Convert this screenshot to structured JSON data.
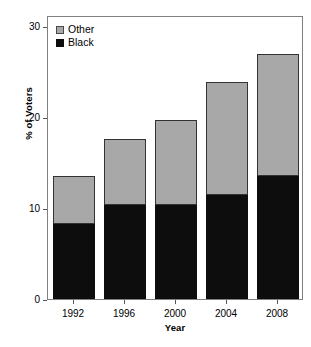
{
  "chart_data": {
    "type": "bar",
    "stacked": true,
    "title": "",
    "subtitle": "",
    "xlabel": "Year",
    "ylabel": "% of Voters",
    "categories": [
      "1992",
      "1996",
      "2000",
      "2004",
      "2008"
    ],
    "series": [
      {
        "name": "Black",
        "color": "#0d0d0d",
        "values": [
          8,
          10,
          10,
          11,
          13
        ]
      },
      {
        "name": "Other",
        "color": "#a8a8a8",
        "values": [
          5,
          7,
          9,
          12,
          13
        ]
      }
    ],
    "totals": [
      13,
      17,
      19,
      23,
      26
    ],
    "ylim": [
      0,
      30
    ],
    "yticks": [
      0,
      10,
      20,
      30
    ],
    "ytick_labels": [
      "0",
      "10",
      "20",
      "30"
    ],
    "grid": false,
    "legend": {
      "position": "top-left",
      "entries": [
        {
          "label": "Other",
          "color": "#a8a8a8"
        },
        {
          "label": "Black",
          "color": "#0d0d0d"
        }
      ]
    },
    "annotations": []
  },
  "axes": {
    "y_label": "% of Voters",
    "x_label": "Year",
    "y_tick_0": "0",
    "y_tick_1": "10",
    "y_tick_2": "20",
    "y_tick_3": "30",
    "x_tick_0": "1992",
    "x_tick_1": "1996",
    "x_tick_2": "2000",
    "x_tick_3": "2004",
    "x_tick_4": "2008"
  },
  "legend": {
    "entry_other": "Other",
    "entry_black": "Black"
  }
}
